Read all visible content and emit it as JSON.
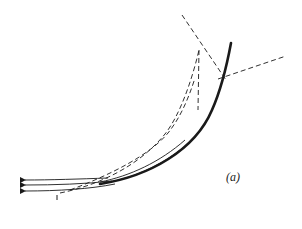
{
  "figure": {
    "panel_label": "(a)",
    "marker_label": "1",
    "colors": {
      "ink": "#1a1a1a",
      "background": "#ffffff"
    },
    "elements": {
      "main_curve": "thick solid curved surface",
      "incident_rays": 3,
      "dashed_construction_lines": 4
    }
  }
}
